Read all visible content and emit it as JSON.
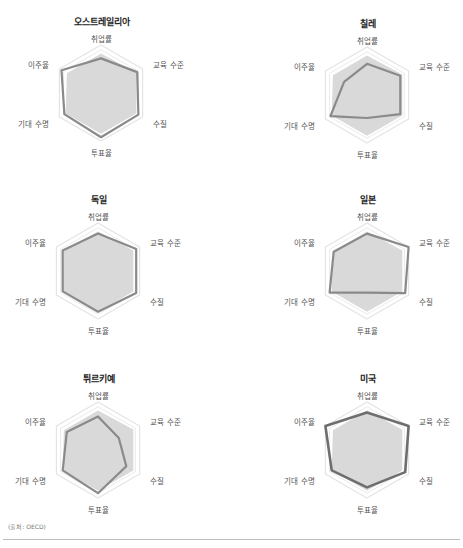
{
  "chart_data": [
    {
      "type": "radar",
      "title": "오스트레일리아",
      "axes": [
        "취업률",
        "교육 수준",
        "수질",
        "투표율",
        "기대 수명",
        "이주율"
      ],
      "series": [
        {
          "name": "오스트레일리아",
          "values": [
            0.72,
            0.87,
            0.9,
            0.92,
            0.88,
            0.95
          ]
        },
        {
          "name": "OECD 평균",
          "values": [
            0.82,
            0.85,
            0.85,
            0.85,
            0.85,
            0.82
          ]
        }
      ],
      "range": [
        0,
        1
      ]
    },
    {
      "type": "radar",
      "title": "칠레",
      "axes": [
        "취업률",
        "교육 수준",
        "수질",
        "투표율",
        "기대 수명",
        "이주율"
      ],
      "series": [
        {
          "name": "칠레",
          "values": [
            0.65,
            0.8,
            0.8,
            0.48,
            0.88,
            0.55
          ]
        },
        {
          "name": "OECD 평균",
          "values": [
            0.82,
            0.85,
            0.85,
            0.85,
            0.85,
            0.82
          ]
        }
      ],
      "range": [
        0,
        1
      ]
    },
    {
      "type": "radar",
      "title": "독일",
      "axes": [
        "취업률",
        "교육 수준",
        "수질",
        "투표율",
        "기대 수명",
        "이주율"
      ],
      "series": [
        {
          "name": "독일",
          "values": [
            0.78,
            0.92,
            0.92,
            0.85,
            0.85,
            0.85
          ]
        },
        {
          "name": "OECD 평균",
          "values": [
            0.82,
            0.85,
            0.85,
            0.85,
            0.85,
            0.82
          ]
        }
      ],
      "range": [
        0,
        1
      ]
    },
    {
      "type": "radar",
      "title": "일본",
      "axes": [
        "취업률",
        "교육 수준",
        "수질",
        "투표율",
        "기대 수명",
        "이주율"
      ],
      "series": [
        {
          "name": "일본",
          "values": [
            0.78,
            1.0,
            0.92,
            0.45,
            0.9,
            0.8
          ]
        },
        {
          "name": "OECD 평균",
          "values": [
            0.82,
            0.85,
            0.85,
            0.85,
            0.85,
            0.82
          ]
        }
      ],
      "range": [
        0,
        1
      ]
    },
    {
      "type": "radar",
      "title": "튀르키예",
      "axes": [
        "취업률",
        "교육 수준",
        "수질",
        "투표율",
        "기대 수명",
        "이주율"
      ],
      "series": [
        {
          "name": "튀르키예",
          "values": [
            0.7,
            0.5,
            0.68,
            0.9,
            0.85,
            0.75
          ]
        },
        {
          "name": "OECD 평균",
          "values": [
            0.82,
            0.85,
            0.85,
            0.85,
            0.85,
            0.82
          ]
        }
      ],
      "range": [
        0,
        1
      ]
    },
    {
      "type": "radar",
      "title": "미국",
      "axes": [
        "취업률",
        "교육 수준",
        "수질",
        "투표율",
        "기대 수명",
        "이주율"
      ],
      "series": [
        {
          "name": "미국",
          "values": [
            0.78,
            1.0,
            0.92,
            0.78,
            0.85,
            1.0
          ]
        },
        {
          "name": "OECD 평균",
          "values": [
            0.82,
            0.85,
            0.85,
            0.85,
            0.85,
            0.82
          ]
        }
      ],
      "range": [
        0,
        1
      ]
    }
  ],
  "colors": {
    "country_line": "#8a8a8a",
    "country_line_strong": "#6e6e6e",
    "average_fill": "#d9d9d9",
    "grid": "#e4e4e4"
  },
  "panels": [
    {
      "title": "오스트레일리아"
    },
    {
      "title": "칠레"
    },
    {
      "title": "독일"
    },
    {
      "title": "일본"
    },
    {
      "title": "튀르키예"
    },
    {
      "title": "미국"
    }
  ],
  "axis_labels": {
    "top": "취업률",
    "upper_right": "교육 수준",
    "lower_right": "수질",
    "bottom": "투표율",
    "lower_left": "기대 수명",
    "upper_left": "이주율"
  },
  "source": "(출처: OECD)"
}
